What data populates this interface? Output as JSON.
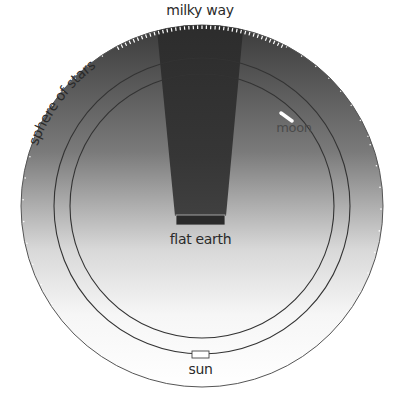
{
  "diagram": {
    "labels": {
      "milky_way": "milky way",
      "sphere_of_stars": "sphere of stars",
      "moon": "moon",
      "flat_earth": "flat earth",
      "sun": "sun"
    },
    "geometry": {
      "center": [
        202,
        206
      ],
      "sphere_of_stars_radius": 181,
      "sun_orbit_radius": 148,
      "moon_orbit_radius": 132
    },
    "colors": {
      "sky_top": "#3a3a3a",
      "sky_bottom": "#f4f4f4",
      "milky_way": "#2e2e2e",
      "earth": "#2a2a2a",
      "ring": "#333333",
      "background": "#ffffff"
    }
  }
}
